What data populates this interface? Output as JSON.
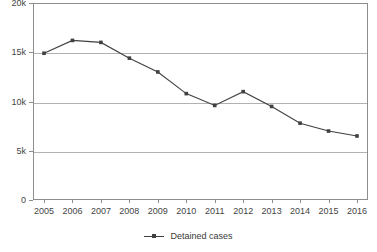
{
  "chart_data": {
    "type": "line",
    "title": "",
    "subtitle": "",
    "xlabel": "",
    "ylabel": "",
    "categories": [
      "2005",
      "2006",
      "2007",
      "2008",
      "2009",
      "2010",
      "2011",
      "2012",
      "2013",
      "2014",
      "2015",
      "2016"
    ],
    "series": [
      {
        "name": "Detained cases",
        "values": [
          14900,
          16200,
          16000,
          14400,
          13000,
          10800,
          9600,
          11000,
          9500,
          7800,
          7000,
          6500
        ],
        "color": "#404040",
        "marker": "square"
      }
    ],
    "ylim": [
      0,
      20000
    ],
    "yticks": [
      0,
      5000,
      10000,
      15000,
      20000
    ],
    "ytick_labels": [
      "0",
      "5k",
      "10k",
      "15k",
      "20k"
    ],
    "grid": "horizontal",
    "legend_position": "bottom-center",
    "legend_entries": [
      "Detained cases"
    ],
    "colors": {
      "series_line": "#404040",
      "gridline": "#b2b2b2",
      "axis": "#8d8d8d",
      "text": "#3a3a3a",
      "background": "#ffffff"
    }
  },
  "legend": {
    "label": "Detained cases",
    "marker_icon": "line-with-square-marker-icon"
  }
}
